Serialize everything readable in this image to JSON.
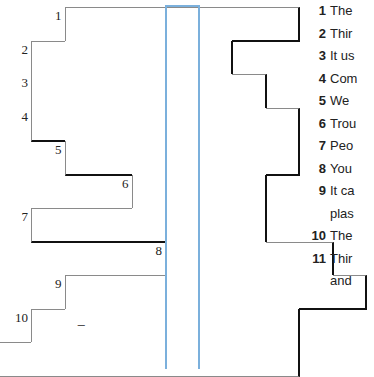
{
  "puzzle": {
    "highlight_color": "#7bb0dc",
    "highlight_column": 4,
    "origin": {
      "x": 31,
      "y": 7
    },
    "cell_size": 33.5,
    "rows": [
      {
        "number": "1",
        "start": 1,
        "end": 8,
        "cells": []
      },
      {
        "number": "2",
        "start": 0,
        "end": 6,
        "cells": []
      },
      {
        "number": "3",
        "start": 0,
        "end": 7,
        "cells": []
      },
      {
        "number": "4",
        "start": 0,
        "end": 8,
        "cells": []
      },
      {
        "number": "5",
        "start": 1,
        "end": 8,
        "cells": []
      },
      {
        "number": "6",
        "start": 3,
        "end": 7,
        "cells": []
      },
      {
        "number": "7",
        "start": 0,
        "end": 7,
        "cells": []
      },
      {
        "number": "8",
        "start": 4,
        "end": 9,
        "cells": []
      },
      {
        "number": "9",
        "start": 1,
        "end": 10,
        "cells": []
      },
      {
        "number": "10",
        "start": 0,
        "end": 8,
        "cells": [
          {
            "col": 1,
            "text": "–"
          }
        ]
      },
      {
        "number": "11",
        "start": -1,
        "end": 8,
        "cells": []
      }
    ]
  },
  "clues": [
    {
      "number": "1",
      "text": "The"
    },
    {
      "number": "2",
      "text": "Thir"
    },
    {
      "number": "3",
      "text": "It us"
    },
    {
      "number": "4",
      "text": "Com"
    },
    {
      "number": "5",
      "text": "We"
    },
    {
      "number": "6",
      "text": "Trou"
    },
    {
      "number": "7",
      "text": "Peo"
    },
    {
      "number": "8",
      "text": "You"
    },
    {
      "number": "9",
      "text": "It ca"
    },
    {
      "number": "",
      "text": "plas"
    },
    {
      "number": "10",
      "text": "The"
    },
    {
      "number": "11",
      "text": "Thir"
    },
    {
      "number": "",
      "text": "and"
    }
  ]
}
